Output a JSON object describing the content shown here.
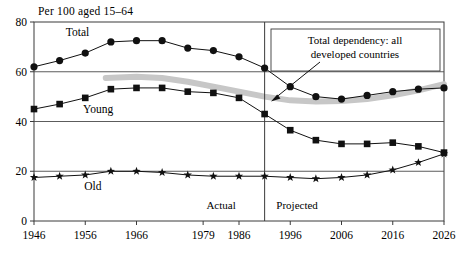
{
  "chart_data": {
    "type": "line",
    "title": "Per 100 aged 15–64",
    "xlabel": "",
    "ylabel": "",
    "ylim": [
      0,
      80
    ],
    "yticks": [
      0,
      20,
      40,
      60,
      80
    ],
    "ytick_labels": [
      "0",
      "20",
      "40",
      "60",
      "80"
    ],
    "grid": "horizontal",
    "xlim": [
      1946,
      2026
    ],
    "xticks": [
      1946,
      1956,
      1966,
      1979,
      1986,
      1996,
      2006,
      2016,
      2026
    ],
    "xtick_labels": [
      "1946",
      "1956",
      "1966",
      "1979",
      "1986",
      "1996",
      "2006",
      "2016",
      "2026"
    ],
    "legend": "inline-labels",
    "x": [
      1946,
      1951,
      1956,
      1961,
      1966,
      1971,
      1976,
      1981,
      1986,
      1991,
      1996,
      2001,
      2006,
      2011,
      2016,
      2021,
      2026
    ],
    "series": [
      {
        "name": "Total",
        "marker": "circle",
        "label": "Total",
        "label_x": 1954.5,
        "label_y": 74.5,
        "values": [
          62.0,
          64.5,
          67.5,
          72.0,
          72.5,
          72.5,
          69.5,
          68.5,
          66.0,
          61.5,
          54.0,
          50.0,
          49.0,
          50.5,
          52.0,
          53.0,
          53.5
        ]
      },
      {
        "name": "Young",
        "marker": "square",
        "label": "Young",
        "label_x": 1958.5,
        "label_y": 43.5,
        "values": [
          45.0,
          47.0,
          49.5,
          53.0,
          53.5,
          53.5,
          52.0,
          51.5,
          49.5,
          43.0,
          36.5,
          32.5,
          31.0,
          31.0,
          31.5,
          30.0,
          27.5
        ]
      },
      {
        "name": "Old",
        "marker": "star",
        "label": "Old",
        "label_x": 1957.5,
        "label_y": 12.5,
        "values": [
          17.5,
          18.0,
          18.5,
          20.0,
          20.0,
          19.5,
          18.5,
          18.0,
          18.0,
          18.0,
          17.5,
          17.0,
          17.5,
          18.5,
          20.5,
          23.5,
          27.0
        ]
      }
    ],
    "overlay": {
      "name": "Total dependency: all developed countries",
      "style": "thick-grey-band",
      "color": "#c7c7c7",
      "x": [
        1960,
        1966,
        1971,
        1976,
        1981,
        1986,
        1991,
        1996,
        2001,
        2006,
        2011,
        2016,
        2021,
        2026
      ],
      "values": [
        57.5,
        58.0,
        57.5,
        56.0,
        54.0,
        52.0,
        50.0,
        48.5,
        48.0,
        48.2,
        49.0,
        50.5,
        52.5,
        55.0
      ]
    },
    "annotations": [
      {
        "name": "overlay-callout",
        "line1": "Total dependency: all",
        "line2": "developed countries",
        "arrow_from_x": 320,
        "arrow_from_y": 62,
        "arrow_to_x": 271,
        "arrow_to_y": 101
      },
      {
        "name": "actual-region-label",
        "text": "Actual",
        "x": 1982.5,
        "y": 5.0
      },
      {
        "name": "projected-region-label",
        "text": "Projected",
        "x": 1992.5,
        "y": 5.0
      }
    ],
    "divider": {
      "name": "actual-projected-divider",
      "x": 1991
    }
  }
}
